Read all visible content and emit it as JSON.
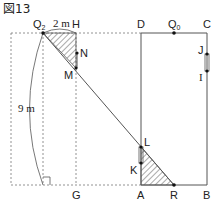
{
  "figure": {
    "title": "図13",
    "labels": {
      "Q2": "Q",
      "Q2_sub": "2",
      "H": "H",
      "D": "D",
      "Q0": "Q",
      "Q0_sub": "0",
      "C": "C",
      "N": "N",
      "M": "M",
      "J": "J",
      "I": "I",
      "L": "L",
      "K": "K",
      "A": "A",
      "R": "R",
      "B": "B",
      "G": "G"
    },
    "dimensions": {
      "width_label": "2 m",
      "height_label": "9 m"
    },
    "colors": {
      "line": "#555555",
      "dashed": "#777777",
      "hatch": "#555555"
    }
  }
}
